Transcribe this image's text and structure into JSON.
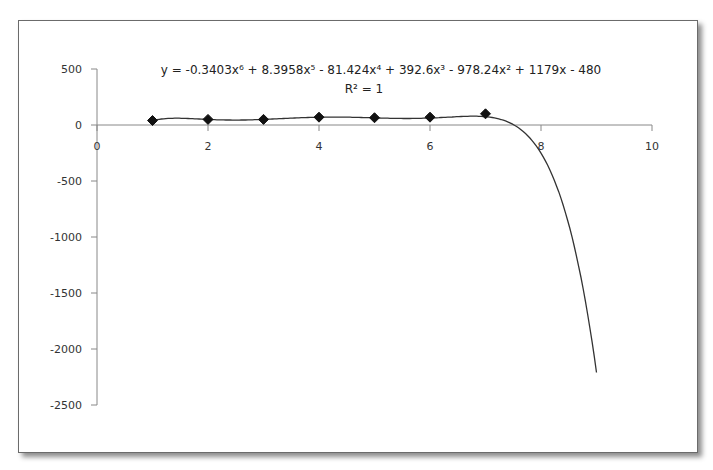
{
  "chart_data": {
    "type": "scatter",
    "title": "",
    "xlabel": "",
    "ylabel": "",
    "xlim": [
      0,
      10
    ],
    "ylim": [
      -2500,
      500
    ],
    "x_ticks": [
      0,
      2,
      4,
      6,
      8,
      10
    ],
    "x_tick_labels": [
      "0",
      "2",
      "4",
      "6",
      "8",
      "10"
    ],
    "y_ticks": [
      500,
      0,
      -500,
      -1000,
      -1500,
      -2000,
      -2500
    ],
    "y_tick_labels": [
      "500",
      "0",
      "-500",
      "-1000",
      "-1500",
      "-2000",
      "-2500"
    ],
    "grid": false,
    "legend": "none",
    "series": [
      {
        "name": "data",
        "marker": "diamond",
        "x": [
          1,
          2,
          3,
          4,
          5,
          6,
          7
        ],
        "y": [
          40,
          50,
          50,
          70,
          65,
          70,
          100
        ]
      }
    ],
    "trendline": {
      "type": "polynomial",
      "order": 6,
      "coefficients": [
        -0.3403,
        8.3958,
        -81.424,
        392.6,
        -978.24,
        1179,
        -480
      ],
      "x_range": [
        1,
        9
      ],
      "equation_label": "y = -0.3403x⁶ + 8.3958x⁵ - 81.424x⁴ + 392.6x³ - 978.24x² + 1179x - 480",
      "r2_label": "R² = 1"
    },
    "annotations": [
      "y = -0.3403x⁶ + 8.3958x⁵ - 81.424x⁴ + 392.6x³ - 978.24x² + 1179x - 480",
      "R² = 1"
    ]
  }
}
